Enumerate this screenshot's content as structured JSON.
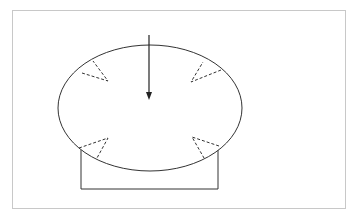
{
  "diagram": {
    "type": "schematic",
    "colors": {
      "stroke": "#333333",
      "frame": "#c8c8c8",
      "background": "#ffffff"
    },
    "ellipse": {
      "cx": 150,
      "cy": 108,
      "rx": 92,
      "ry": 63
    },
    "arrow": {
      "x": 149,
      "y1": 35,
      "y2": 100,
      "direction": "down"
    },
    "stand": {
      "left": 81,
      "right": 218,
      "top": 150,
      "bottom": 189
    },
    "markers": [
      {
        "name": "top-left",
        "points": [
          [
            78,
            68
          ],
          [
            93,
            61
          ],
          [
            108,
            81
          ]
        ]
      },
      {
        "name": "top-right",
        "points": [
          [
            221,
            70
          ],
          [
            203,
            62
          ],
          [
            190,
            82
          ]
        ]
      },
      {
        "name": "bottom-left",
        "points": [
          [
            78,
            149
          ],
          [
            98,
            143
          ],
          [
            108,
            138
          ]
        ]
      },
      {
        "name": "bottom-right",
        "points": [
          [
            219,
            146
          ],
          [
            204,
            158
          ],
          [
            192,
            137
          ]
        ]
      }
    ]
  }
}
